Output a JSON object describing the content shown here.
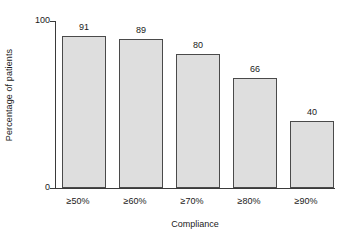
{
  "chart_data": {
    "type": "bar",
    "title": "",
    "subtitle": "",
    "categories": [
      "≥50%",
      "≥60%",
      "≥70%",
      "≥80%",
      "≥90%"
    ],
    "values": [
      91,
      89,
      80,
      66,
      40
    ],
    "value_labels": [
      "91",
      "89",
      "80",
      "66",
      "40"
    ],
    "xlabel": "Compliance",
    "ylabel": "Percentage of patients",
    "ylim": [
      0,
      100
    ],
    "yticks": [
      0,
      100
    ],
    "ytick_labels": [
      "0",
      "100"
    ],
    "grid": false,
    "legend": null,
    "legend_position": "none",
    "colors": {
      "bar_fill": "#dedede",
      "bar_edge": "#4a4a4a",
      "axis": "#3a3a3a",
      "text": "#1a1a1a",
      "background": "#ffffff"
    }
  },
  "axis": {
    "y": {
      "title": "Percentage of patients",
      "tick_top": "100",
      "tick_bottom": "0"
    },
    "x": {
      "title": "Compliance"
    }
  }
}
